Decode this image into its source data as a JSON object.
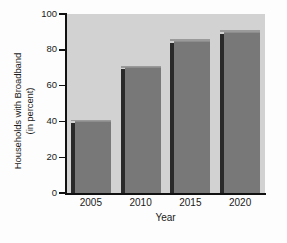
{
  "chart_data": {
    "type": "bar",
    "title": "",
    "categories": [
      "2005",
      "2010",
      "2015",
      "2020"
    ],
    "values": [
      41,
      71,
      86,
      91
    ],
    "series": [
      {
        "name": "Households with Broadband",
        "values": [
          41,
          71,
          86,
          91
        ]
      }
    ],
    "xlabel": "Year",
    "ylabel": "Households with Broadband (in percent)",
    "ylabel_line1": "Households with Broadband",
    "ylabel_line2": "(in percent)",
    "ylim": [
      0,
      100
    ],
    "yticks": [
      "0",
      "20",
      "40",
      "60",
      "80",
      "100"
    ],
    "ytick_values": [
      0,
      20,
      40,
      60,
      80,
      100
    ],
    "xticks": [
      "2005",
      "2010",
      "2015",
      "2020"
    ],
    "grid": false,
    "legend": "none",
    "bar_face_color": "#787878",
    "bar_side_color": "#2a2a2a",
    "bar_top_color": "#8d8d8d",
    "plot_background_color": "#d2d2d2",
    "axis_color": "#111111",
    "figure_background_color": "#fdfdfd"
  },
  "caption": {
    "text": "",
    "visible": "partial"
  }
}
